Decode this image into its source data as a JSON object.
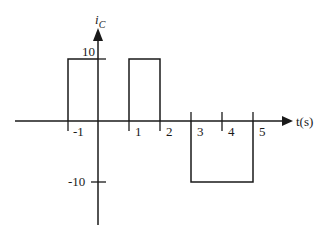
{
  "diagram": {
    "y_axis_label": "i",
    "y_axis_subscript": "C",
    "x_axis_label": "t(s)",
    "x_ticks": [
      "-1",
      "1",
      "2",
      "3",
      "4",
      "5"
    ],
    "y_ticks": [
      "10",
      "-10"
    ],
    "waveform": [
      {
        "t_start": -1,
        "t_end": 0,
        "value": 10
      },
      {
        "t_start": 1,
        "t_end": 2,
        "value": 10
      },
      {
        "t_start": 3,
        "t_end": 5,
        "value": -10
      }
    ],
    "stroke_color": "#1a1a1a"
  }
}
